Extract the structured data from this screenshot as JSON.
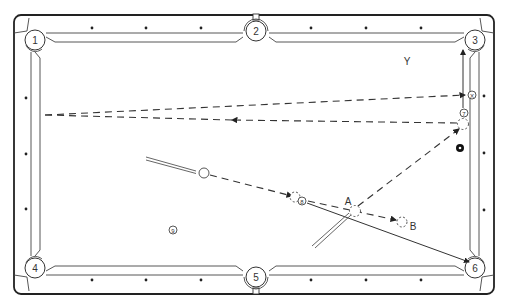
{
  "diagram": {
    "colors": {
      "line": "#333333",
      "background": "#ffffff",
      "black_ball": "#111111"
    },
    "pockets": [
      {
        "label": "1",
        "x": 35,
        "y": 40
      },
      {
        "label": "2",
        "x": 256,
        "y": 31
      },
      {
        "label": "3",
        "x": 475,
        "y": 40
      },
      {
        "label": "4",
        "x": 35,
        "y": 268
      },
      {
        "label": "5",
        "x": 256,
        "y": 277
      },
      {
        "label": "6",
        "x": 475,
        "y": 268
      }
    ],
    "balls": {
      "seven": {
        "label": "7",
        "x": 464,
        "y": 113
      },
      "eight": {
        "label": "8",
        "x": 302,
        "y": 201
      },
      "nine": {
        "label": "9",
        "x": 173,
        "y": 230
      },
      "x_marker": {
        "label": "X",
        "x": 472,
        "y": 95
      }
    },
    "labels": {
      "y": "Y",
      "a": "A",
      "b": "B"
    }
  }
}
